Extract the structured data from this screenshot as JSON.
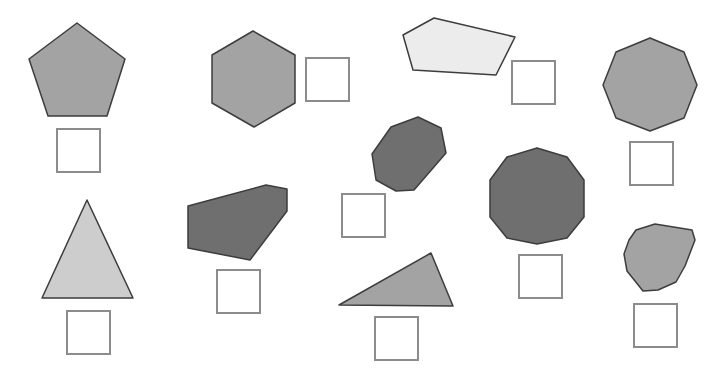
{
  "worksheet": {
    "instruction": "",
    "colors": {
      "medium_gray": "#a3a3a3",
      "light_gray": "#cdcdcd",
      "very_light_gray": "#ececec",
      "dark_gray": "#6f6f6f",
      "outline": "#3d3d3d",
      "box_border": "#8c8c8c"
    },
    "shapes": [
      {
        "id": "pentagon",
        "name": "Pentagon",
        "sides": 5,
        "fill": "#a3a3a3",
        "points": "77,23 125,59 107,116 48,116 29,59",
        "answer_box": {
          "x": 56,
          "y": 128,
          "value": ""
        }
      },
      {
        "id": "hexagon",
        "name": "Hexagon",
        "sides": 6,
        "fill": "#a3a3a3",
        "points": "253,31 295,55 295,103 254,127 212,103 212,55",
        "answer_box": {
          "x": 305,
          "y": 57,
          "value": ""
        }
      },
      {
        "id": "irregular-pentagon",
        "name": "Irregular pentagon",
        "sides": 5,
        "fill": "#ececec",
        "points": "403,35 434,18 515,37 496,75 413,70",
        "answer_box": {
          "x": 511,
          "y": 60,
          "value": ""
        }
      },
      {
        "id": "octagon",
        "name": "Octagon",
        "sides": 8,
        "fill": "#a3a3a3",
        "points": "650,38 684,52 697,85 684,118 650,131 616,118 603,85 616,52",
        "answer_box": {
          "x": 629,
          "y": 141,
          "value": ""
        }
      },
      {
        "id": "irregular-octagon",
        "name": "Irregular octagon",
        "sides": 8,
        "fill": "#6f6f6f",
        "points": "391,127 418,117 441,128 446,153 414,190 396,191 376,180 372,154",
        "answer_box": {
          "x": 341,
          "y": 193,
          "value": ""
        }
      },
      {
        "id": "decagon",
        "name": "Decagon",
        "sides": 10,
        "fill": "#6f6f6f",
        "points": "537,148 567,157 584,180 584,217 567,238 537,244 507,238 490,217 490,180 507,157",
        "answer_box": {
          "x": 518,
          "y": 254,
          "value": ""
        }
      },
      {
        "id": "triangle",
        "name": "Isosceles triangle",
        "sides": 3,
        "fill": "#cdcdcd",
        "points": "87,200 133,298 42,298",
        "answer_box": {
          "x": 66,
          "y": 310,
          "value": ""
        }
      },
      {
        "id": "irregular-hexagon",
        "name": "Irregular hexagon",
        "sides": 6,
        "fill": "#6f6f6f",
        "points": "188,206 266,185 287,189 287,211 250,260 188,248",
        "answer_box": {
          "x": 216,
          "y": 269,
          "value": ""
        }
      },
      {
        "id": "scalene-triangle",
        "name": "Scalene triangle",
        "sides": 3,
        "fill": "#a3a3a3",
        "points": "339,305 431,253 453,306",
        "answer_box": {
          "x": 374,
          "y": 316,
          "value": ""
        }
      },
      {
        "id": "irregular-polygon",
        "name": "Irregular 11-gon",
        "sides": 11,
        "fill": "#a3a3a3",
        "points": "636,230 655,224 692,230 695,240 685,266 676,282 658,290 643,291 627,271 624,254 629,240",
        "answer_box": {
          "x": 633,
          "y": 303,
          "value": ""
        }
      }
    ]
  }
}
